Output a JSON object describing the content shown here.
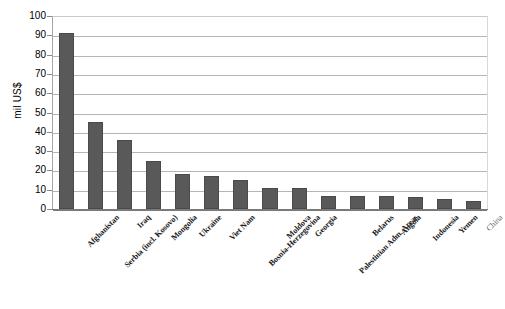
{
  "chart_data": {
    "type": "bar",
    "title": "",
    "xlabel": "",
    "ylabel": "mil US$",
    "ylim": [
      0,
      100
    ],
    "ytick_step": 10,
    "grid": true,
    "legend": "none",
    "bar_color": "#595959",
    "categories": [
      "Afghanistan",
      "Serbia (incl. Kosovo)",
      "Iraq",
      "Mongolia",
      "Ukraine",
      "Viet Nam",
      "Bosnia-Herzegovina",
      "Moldova",
      "Georgia",
      "Palestinian Adm. Areas",
      "Belarus",
      "Angola",
      "Indonesia",
      "Yemen",
      "China"
    ],
    "values": [
      91,
      45,
      36,
      25,
      18,
      17,
      15,
      11,
      11,
      7,
      7,
      7,
      6,
      5,
      4
    ],
    "ytick_labels": [
      "100",
      "90",
      "80",
      "70",
      "60",
      "50",
      "40",
      "30",
      "20",
      "10",
      "0"
    ],
    "faint_categories": [
      "China"
    ]
  }
}
